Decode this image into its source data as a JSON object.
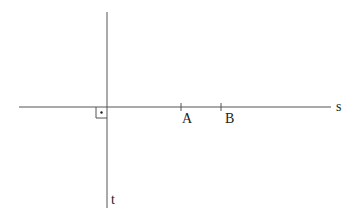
{
  "diagram": {
    "colors": {
      "line": "#555555",
      "text": "#222222",
      "background": "#ffffff"
    },
    "lines": [
      {
        "name": "s",
        "label": "s",
        "orientation": "horizontal"
      },
      {
        "name": "t",
        "label": "t",
        "orientation": "vertical"
      }
    ],
    "points": [
      {
        "name": "A",
        "label": "A",
        "on_line": "s"
      },
      {
        "name": "B",
        "label": "B",
        "on_line": "s"
      }
    ],
    "right_angle_marker": {
      "between": [
        "s",
        "t"
      ],
      "has_dot": true
    }
  }
}
